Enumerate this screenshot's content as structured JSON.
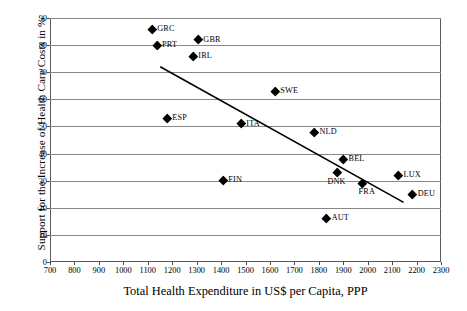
{
  "chart_data": {
    "type": "scatter",
    "title": "",
    "xlabel": "Total Health Expenditure in US$ per Capita, PPP",
    "ylabel": "Support for the Increase of Health Care Costs in %",
    "xlim": [
      700,
      2300
    ],
    "ylim": [
      0,
      90
    ],
    "xticks": [
      700,
      800,
      900,
      1000,
      1100,
      1200,
      1300,
      1400,
      1500,
      1600,
      1700,
      1800,
      1900,
      2000,
      2100,
      2200,
      2300
    ],
    "yticks": [
      0,
      10,
      20,
      30,
      40,
      50,
      60,
      70,
      80,
      90
    ],
    "grid": "horizontal",
    "legend": "none",
    "marker": "diamond",
    "marker_color": "#000000",
    "points": [
      {
        "label": "GRC",
        "x": 1118,
        "y": 86,
        "label_pos": "right"
      },
      {
        "label": "GBR",
        "x": 1307,
        "y": 82,
        "label_pos": "right"
      },
      {
        "label": "PRT",
        "x": 1138,
        "y": 80,
        "label_pos": "right"
      },
      {
        "label": "IRL",
        "x": 1286,
        "y": 76,
        "label_pos": "right"
      },
      {
        "label": "SWE",
        "x": 1622,
        "y": 63,
        "label_pos": "right"
      },
      {
        "label": "ESP",
        "x": 1180,
        "y": 53,
        "label_pos": "right"
      },
      {
        "label": "ITA",
        "x": 1483,
        "y": 51,
        "label_pos": "right"
      },
      {
        "label": "NLD",
        "x": 1782,
        "y": 48,
        "label_pos": "right"
      },
      {
        "label": "BEL",
        "x": 1901,
        "y": 38,
        "label_pos": "right"
      },
      {
        "label": "DNK",
        "x": 1876,
        "y": 33,
        "label_pos": "belowleft"
      },
      {
        "label": "LUX",
        "x": 2126,
        "y": 32,
        "label_pos": "right"
      },
      {
        "label": "FRA",
        "x": 1979,
        "y": 29,
        "label_pos": "below"
      },
      {
        "label": "DEU",
        "x": 2184,
        "y": 25,
        "label_pos": "right"
      },
      {
        "label": "FIN",
        "x": 1409,
        "y": 30,
        "label_pos": "right"
      },
      {
        "label": "AUT",
        "x": 1832,
        "y": 16,
        "label_pos": "right"
      }
    ],
    "trendline": {
      "type": "linear",
      "x_start": 1151,
      "y_start": 72,
      "x_end": 2147,
      "y_end": 22,
      "color": "#000000"
    }
  }
}
